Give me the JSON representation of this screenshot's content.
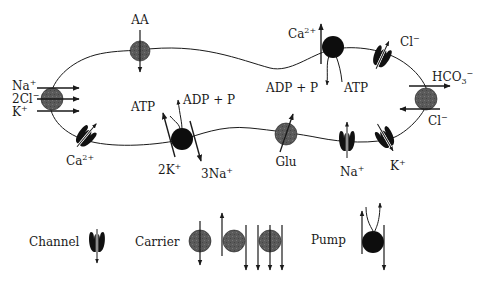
{
  "diagram": {
    "colors": {
      "line": "#1a1a1a",
      "carrier_fill": "#5a5a5a",
      "pump_fill": "#0d0d0d",
      "channel_fill": "#111111",
      "background": "#ffffff"
    },
    "transporters": [
      {
        "type": "carrier",
        "name": "AA",
        "labels": [
          "AA"
        ]
      },
      {
        "type": "pump",
        "name": "Ca-ATPase",
        "labels": [
          "Ca",
          "2+",
          "ADP + P",
          "ATP"
        ]
      },
      {
        "type": "channel",
        "name": "Cl-channel-top",
        "labels": [
          "Cl",
          "−"
        ]
      },
      {
        "type": "carrier",
        "name": "Na-2Cl-K cotransporter",
        "labels": [
          "Na",
          "+",
          "2Cl",
          "−",
          "K",
          "+"
        ]
      },
      {
        "type": "carrier",
        "name": "HCO3-Cl exchanger",
        "labels": [
          "HCO",
          "3",
          "−",
          "Cl",
          "−"
        ]
      },
      {
        "type": "channel",
        "name": "Ca-channel",
        "labels": [
          "Ca",
          "2+"
        ]
      },
      {
        "type": "pump",
        "name": "Na-K-ATPase",
        "labels": [
          "ATP",
          "ADP + P",
          "2K",
          "+",
          "3Na",
          "+"
        ]
      },
      {
        "type": "carrier",
        "name": "Glu",
        "labels": [
          "Glu"
        ]
      },
      {
        "type": "channel",
        "name": "Na-channel",
        "labels": [
          "Na",
          "+"
        ]
      },
      {
        "type": "channel",
        "name": "K-channel",
        "labels": [
          "K",
          "+"
        ]
      }
    ],
    "legend": {
      "channel": "Channel",
      "carrier": "Carrier",
      "pump": "Pump"
    }
  }
}
